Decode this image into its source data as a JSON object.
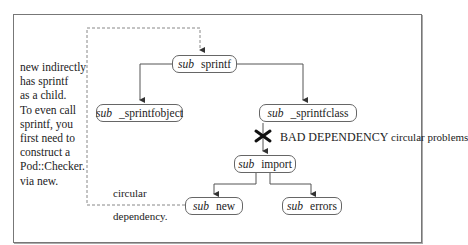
{
  "note": {
    "lines": [
      "new indirectly",
      "has sprintf",
      "as a child.",
      "To even call",
      "sprintf, you",
      "first need to",
      "construct a",
      "Pod::Checker.",
      "via new."
    ]
  },
  "nodes": {
    "sprintf": {
      "keyword": "sub",
      "name": "sprintf"
    },
    "sprintfobject": {
      "keyword": "sub",
      "name": "_sprintfobject"
    },
    "sprintfclass": {
      "keyword": "sub",
      "name": "_sprintfclass"
    },
    "import": {
      "keyword": "sub",
      "name": "import"
    },
    "new": {
      "keyword": "sub",
      "name": "new"
    },
    "errors": {
      "keyword": "sub",
      "name": "errors"
    }
  },
  "labels": {
    "bad_dependency_caps": "BAD DEPENDENCY",
    "bad_dependency_rest": "circular problems",
    "circular_top": "circular",
    "circular_bottom": "dependency."
  },
  "edges": [
    {
      "from": "sprintf",
      "to": "sprintfobject",
      "style": "solid"
    },
    {
      "from": "sprintf",
      "to": "sprintfclass",
      "style": "solid"
    },
    {
      "from": "sprintfclass",
      "to": "import",
      "style": "solid",
      "marker": "X (bad dependency)"
    },
    {
      "from": "import",
      "to": "new",
      "style": "solid"
    },
    {
      "from": "import",
      "to": "errors",
      "style": "solid"
    },
    {
      "from": "new",
      "to": "sprintf",
      "style": "dashed",
      "label": "circular dependency."
    }
  ],
  "colors": {
    "line": "#555555",
    "frame": "#777777",
    "text": "#222222"
  }
}
